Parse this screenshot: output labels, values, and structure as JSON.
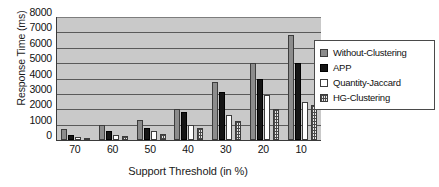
{
  "chart_data": {
    "type": "bar",
    "title": "",
    "xlabel": "Support Threshold (in %)",
    "ylabel": "Response Time (ms)",
    "categories": [
      "70",
      "60",
      "50",
      "40",
      "30",
      "20",
      "10"
    ],
    "yticks": [
      8000,
      7000,
      6000,
      5000,
      4000,
      3000,
      2000,
      1000,
      0
    ],
    "ylim": [
      0,
      8000
    ],
    "grid": true,
    "legend_position": "right",
    "series": [
      {
        "name": "Without-Clustering",
        "swatch": "gray-solid",
        "color": "#8c8c8c",
        "values": [
          700,
          1000,
          1300,
          2000,
          3800,
          5000,
          6800
        ]
      },
      {
        "name": "APP",
        "swatch": "black-solid",
        "color": "#151515",
        "values": [
          350,
          600,
          800,
          1800,
          3100,
          4000,
          5000
        ]
      },
      {
        "name": "Quantity-Jaccard",
        "swatch": "white-solid",
        "color": "#ffffff",
        "values": [
          200,
          350,
          600,
          1000,
          1600,
          2900,
          2500
        ]
      },
      {
        "name": "HG-Clustering",
        "swatch": "grid-hatch",
        "color": "#e8e8e8",
        "values": [
          150,
          250,
          400,
          800,
          1250,
          2000,
          2300
        ]
      }
    ]
  },
  "plot_style": {
    "plot_background": "#c9c9c9",
    "gridline_color": "#5a5a5a",
    "axis_color": "#3a3a3a"
  }
}
